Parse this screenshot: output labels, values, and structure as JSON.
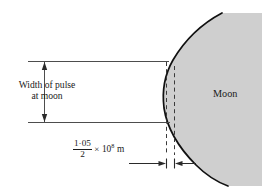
{
  "figure": {
    "labels": {
      "pulse_line1": "Width of pulse",
      "pulse_line2": "at moon",
      "moon": "Moon",
      "distance_numerator": "1·05",
      "distance_denominator": "2",
      "distance_times": "×",
      "distance_base": "10",
      "distance_exponent": "8",
      "distance_unit": "m"
    },
    "colors": {
      "moon_fill": "#cfcfcf",
      "outline": "#111111",
      "line": "#4d4d4d",
      "background": "#ffffff"
    },
    "geometry": {
      "top_rule_y": 61,
      "bottom_rule_y": 122,
      "rule_left_x": 28,
      "dim_line_x": 44,
      "dash_left_x": 166,
      "dash_right_x": 174,
      "baseline_y": 164
    }
  }
}
